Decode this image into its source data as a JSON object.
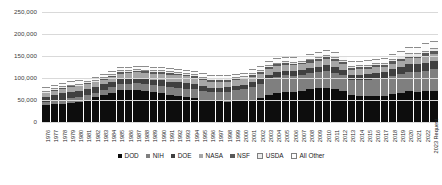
{
  "chart_data": {
    "type": "bar",
    "subtype": "stacked-column",
    "title": "",
    "xlabel": "",
    "ylabel": "",
    "ylim": [
      0,
      250000
    ],
    "yticks": [
      0,
      50000,
      100000,
      150000,
      200000,
      250000
    ],
    "ytick_labels": [
      "0",
      "50,000",
      "100,000",
      "150,000",
      "200,000",
      "250,000"
    ],
    "grid": true,
    "legend_position": "bottom",
    "units": "millions of dollars",
    "categories": [
      "1976",
      "1977",
      "1978",
      "1979",
      "1980",
      "1981",
      "1982",
      "1983",
      "1984",
      "1985",
      "1986",
      "1987",
      "1988",
      "1989",
      "1990",
      "1991",
      "1992",
      "1993",
      "1994",
      "1995",
      "1996",
      "1997",
      "1998",
      "1999",
      "2000",
      "2001",
      "2002",
      "2003",
      "2004",
      "2005",
      "2006",
      "2007",
      "2008",
      "2009",
      "2010",
      "2011",
      "2012",
      "2013",
      "2014",
      "2015",
      "2016",
      "2017",
      "2018",
      "2019",
      "2020",
      "2021",
      "2022",
      "2023 Request"
    ],
    "series": [
      {
        "name": "DOD",
        "color": "#0d0d0d",
        "values": [
          38000,
          40000,
          41000,
          43000,
          45000,
          50000,
          56000,
          61000,
          66000,
          72000,
          73000,
          73000,
          71000,
          68000,
          66000,
          62000,
          59000,
          57000,
          54000,
          50000,
          48000,
          47000,
          46000,
          47000,
          47000,
          50000,
          54000,
          61000,
          66000,
          69000,
          69000,
          71000,
          75000,
          77000,
          78000,
          75000,
          70000,
          62000,
          60000,
          60000,
          60000,
          60000,
          64000,
          67000,
          70000,
          69000,
          70000,
          70000
        ]
      },
      {
        "name": "NIH",
        "color": "#7f7f7f",
        "values": [
          8000,
          9000,
          10000,
          11000,
          11000,
          11000,
          11000,
          12000,
          13000,
          14000,
          14000,
          15000,
          16000,
          16000,
          17000,
          18000,
          19000,
          19000,
          20000,
          20000,
          20000,
          21000,
          23000,
          25000,
          27000,
          30000,
          33000,
          36000,
          37000,
          37000,
          36000,
          36000,
          36000,
          37000,
          38000,
          37000,
          36000,
          34000,
          35000,
          36000,
          38000,
          39000,
          41000,
          42000,
          44000,
          45000,
          47000,
          50000
        ]
      },
      {
        "name": "DOE",
        "color": "#404040",
        "values": [
          10000,
          12000,
          14000,
          15000,
          15000,
          15000,
          13000,
          13000,
          13000,
          13000,
          12000,
          12000,
          12000,
          12000,
          12000,
          12000,
          12000,
          12000,
          12000,
          11000,
          10000,
          10000,
          10000,
          10000,
          10000,
          10000,
          10000,
          11000,
          11000,
          11000,
          11000,
          11000,
          11000,
          12000,
          14000,
          14000,
          13000,
          12000,
          13000,
          13000,
          14000,
          14000,
          15000,
          16000,
          17000,
          17000,
          18000,
          19000
        ]
      },
      {
        "name": "NASA",
        "color": "#a6a6a6",
        "values": [
          9000,
          9000,
          10000,
          10000,
          10000,
          10000,
          10000,
          10000,
          11000,
          11000,
          12000,
          13000,
          13000,
          14000,
          15000,
          16000,
          16000,
          16000,
          15000,
          15000,
          14000,
          14000,
          13000,
          13000,
          13000,
          13000,
          13000,
          13000,
          13000,
          13000,
          13000,
          13000,
          13000,
          13000,
          13000,
          12000,
          12000,
          11000,
          12000,
          12000,
          12000,
          12000,
          13000,
          13000,
          14000,
          14000,
          15000,
          15000
        ]
      },
      {
        "name": "NSF",
        "color": "#595959",
        "values": [
          2000,
          2000,
          2000,
          2000,
          2000,
          2000,
          2000,
          2000,
          2000,
          3000,
          3000,
          3000,
          3000,
          3000,
          3000,
          3000,
          3000,
          3000,
          3000,
          3000,
          3000,
          3000,
          3000,
          3000,
          4000,
          4000,
          4000,
          4000,
          4000,
          4000,
          4000,
          4000,
          5000,
          5000,
          5000,
          5000,
          5000,
          5000,
          5000,
          5000,
          5000,
          5000,
          6000,
          6000,
          6000,
          6000,
          7000,
          8000
        ]
      },
      {
        "name": "USDA",
        "color": "#ececec",
        "values": [
          2000,
          2000,
          2000,
          2000,
          2000,
          2000,
          2000,
          2000,
          2000,
          2000,
          2000,
          2000,
          2000,
          2000,
          2000,
          2000,
          2000,
          2000,
          2000,
          2000,
          2000,
          2000,
          2000,
          2000,
          2000,
          2000,
          2000,
          2000,
          2000,
          2000,
          2000,
          2000,
          2000,
          2000,
          2000,
          2000,
          2000,
          2000,
          2000,
          2000,
          2000,
          2000,
          2000,
          3000,
          3000,
          3000,
          3000,
          3000
        ]
      },
      {
        "name": "All Other",
        "color": "#fdfdfd",
        "values": [
          5000,
          5000,
          5000,
          6000,
          6000,
          6000,
          5000,
          5000,
          5000,
          5000,
          5000,
          5000,
          5000,
          5000,
          5000,
          5000,
          5000,
          5000,
          5000,
          5000,
          5000,
          5000,
          5000,
          5000,
          5000,
          6000,
          7000,
          8000,
          8000,
          8000,
          8000,
          8000,
          8000,
          9000,
          9000,
          9000,
          8000,
          8000,
          8000,
          8000,
          8000,
          8000,
          9000,
          9000,
          11000,
          13000,
          14000,
          15000
        ]
      }
    ]
  },
  "legend": {
    "items": [
      {
        "label": "DOD"
      },
      {
        "label": "NIH"
      },
      {
        "label": "DOE"
      },
      {
        "label": "NASA"
      },
      {
        "label": "NSF"
      },
      {
        "label": "USDA"
      },
      {
        "label": "All Other"
      }
    ]
  }
}
